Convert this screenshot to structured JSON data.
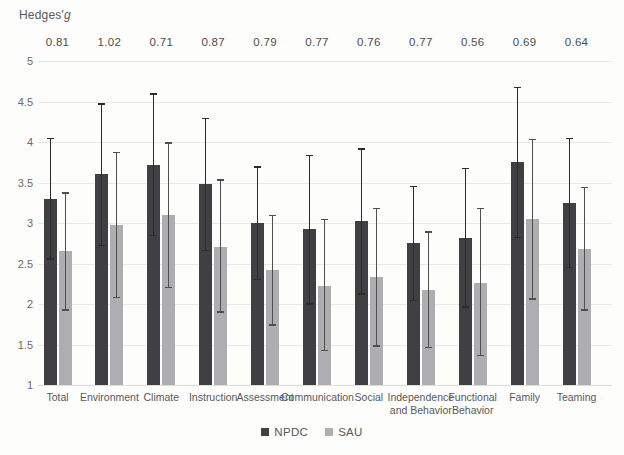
{
  "title": {
    "prefix": "Hedges'",
    "symbol": "g"
  },
  "chart_data": {
    "type": "bar",
    "title": "Hedges'g",
    "ylabel": "",
    "xlabel": "",
    "ylim": [
      1,
      5
    ],
    "y_ticks": [
      "5",
      "4.5",
      "4",
      "3.5",
      "3",
      "2.5",
      "2",
      "1.5",
      "1"
    ],
    "grid": true,
    "legend_position": "bottom",
    "categories": [
      "Total",
      "Environment",
      "Climate",
      "Instruction",
      "Assessment",
      "Communication",
      "Social",
      "Independence and Behavior",
      "Functional Behavior",
      "Family",
      "Teaming"
    ],
    "effect_size_labels": [
      "0.81",
      "1.02",
      "0.71",
      "0.87",
      "0.79",
      "0.77",
      "0.76",
      "0.77",
      "0.56",
      "0.69",
      "0.64"
    ],
    "series": [
      {
        "name": "NPDC",
        "color": "#404042",
        "error_color": "#2b2b2b",
        "values": [
          3.3,
          3.6,
          3.72,
          3.48,
          3.0,
          2.92,
          3.02,
          2.75,
          2.82,
          3.75,
          3.25
        ],
        "error_high": [
          4.05,
          4.48,
          4.6,
          4.3,
          3.7,
          3.84,
          3.92,
          3.46,
          3.68,
          4.68,
          4.05
        ],
        "error_low": [
          2.55,
          2.72,
          2.84,
          2.66,
          2.3,
          2.0,
          2.12,
          2.04,
          1.96,
          2.82,
          2.45
        ]
      },
      {
        "name": "SAU",
        "color": "#aeaeb0",
        "error_color": "#4f4f4f",
        "values": [
          2.65,
          2.98,
          3.1,
          2.7,
          2.42,
          2.22,
          2.33,
          2.17,
          2.26,
          3.05,
          2.68
        ],
        "error_high": [
          3.38,
          3.88,
          4.0,
          3.54,
          3.1,
          3.05,
          3.19,
          2.9,
          3.19,
          4.04,
          3.45
        ],
        "error_low": [
          1.92,
          2.08,
          2.2,
          1.9,
          1.74,
          1.42,
          1.48,
          1.46,
          1.36,
          2.06,
          1.92
        ]
      }
    ]
  },
  "colors": {
    "gridline": "#e9e9e9",
    "axis_text": "#6a6a6a",
    "annotation_text": "#4d4d4d",
    "background": "#fdfdfc"
  }
}
